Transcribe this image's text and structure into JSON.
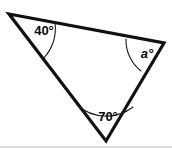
{
  "figure": {
    "type": "geometry-diagram",
    "shape": "triangle",
    "background_color": "#ffffff",
    "stroke_color": "#111111",
    "label_color": "#0a0a0a",
    "vertices": [
      {
        "name": "top-left",
        "x": 9,
        "y": 14
      },
      {
        "name": "right",
        "x": 164,
        "y": 43
      },
      {
        "name": "bottom",
        "x": 106,
        "y": 141
      }
    ],
    "angles": [
      {
        "id": "angle-top-left",
        "label": "40°",
        "value": 40,
        "unit": "degrees",
        "label_x": 44,
        "label_y": 32,
        "italic": false,
        "arc": "M 55 22 A 46 46 0 0 1 43 59"
      },
      {
        "id": "angle-right",
        "label": "a°",
        "value": null,
        "unit": "degrees",
        "label_x": 147,
        "label_y": 55,
        "italic": true,
        "arc": "M 126 39 A 39 39 0 0 0 141 71"
      },
      {
        "id": "angle-bottom",
        "label": "70°",
        "value": 70,
        "unit": "degrees",
        "label_x": 108,
        "label_y": 118,
        "italic": false,
        "arc": "M 77 105 A 44 44 0 0 0 133 107"
      }
    ],
    "edges": [
      {
        "id": "edge-top",
        "from": "top-left",
        "to": "right"
      },
      {
        "id": "edge-right",
        "from": "right",
        "to": "bottom"
      },
      {
        "id": "edge-left",
        "from": "bottom",
        "to": "top-left"
      }
    ],
    "outline_path": "M 9 14 L 164 43 L 106 141 Z"
  }
}
